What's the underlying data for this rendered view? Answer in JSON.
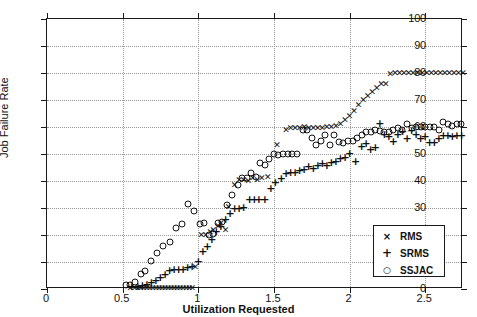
{
  "chart_data": {
    "type": "scatter",
    "title": "",
    "xlabel": "Utilization Requested",
    "ylabel": "Job Failure Rate",
    "xlim": [
      0,
      2.75
    ],
    "ylim": [
      0,
      100
    ],
    "xticks": [
      "0",
      "0.5",
      "1",
      "1.5",
      "2",
      "2.5"
    ],
    "xtick_values": [
      0,
      0.5,
      1,
      1.5,
      2,
      2.5
    ],
    "yticks": [
      "0",
      "10",
      "20",
      "30",
      "40",
      "50",
      "60",
      "70",
      "80",
      "90",
      "100"
    ],
    "ytick_values": [
      0,
      10,
      20,
      30,
      40,
      50,
      60,
      70,
      80,
      90,
      100
    ],
    "grid": true,
    "legend_position": "lower-right",
    "series": [
      {
        "name": "RMS",
        "marker": "x",
        "points": [
          [
            0.55,
            0.3
          ],
          [
            0.58,
            0.3
          ],
          [
            0.6,
            0.3
          ],
          [
            0.62,
            0.3
          ],
          [
            0.64,
            0.3
          ],
          [
            0.66,
            0.3
          ],
          [
            0.68,
            0.3
          ],
          [
            0.7,
            0.3
          ],
          [
            0.72,
            0.3
          ],
          [
            0.74,
            0.3
          ],
          [
            0.76,
            0.3
          ],
          [
            0.78,
            0.3
          ],
          [
            0.8,
            0.3
          ],
          [
            0.82,
            0.3
          ],
          [
            0.84,
            0.3
          ],
          [
            0.86,
            0.3
          ],
          [
            0.88,
            0.3
          ],
          [
            0.9,
            0.3
          ],
          [
            0.92,
            0.3
          ],
          [
            0.94,
            0.3
          ],
          [
            0.96,
            0.3
          ],
          [
            0.98,
            8.0
          ],
          [
            1.02,
            20.0
          ],
          [
            1.05,
            20.0
          ],
          [
            1.08,
            21.0
          ],
          [
            1.1,
            22.0
          ],
          [
            1.13,
            23.5
          ],
          [
            1.15,
            24.5
          ],
          [
            1.18,
            22.0
          ],
          [
            1.2,
            30.5
          ],
          [
            1.24,
            38.5
          ],
          [
            1.27,
            40.5
          ],
          [
            1.3,
            40.5
          ],
          [
            1.33,
            40.0
          ],
          [
            1.36,
            41.0
          ],
          [
            1.39,
            40.5
          ],
          [
            1.42,
            41.0
          ],
          [
            1.46,
            41.5
          ],
          [
            1.52,
            53.5
          ],
          [
            1.58,
            59.0
          ],
          [
            1.61,
            59.5
          ],
          [
            1.64,
            59.5
          ],
          [
            1.67,
            59.5
          ],
          [
            1.7,
            60.0
          ],
          [
            1.73,
            59.5
          ],
          [
            1.76,
            59.5
          ],
          [
            1.79,
            59.5
          ],
          [
            1.82,
            59.5
          ],
          [
            1.85,
            60.0
          ],
          [
            1.88,
            60.0
          ],
          [
            1.91,
            60.5
          ],
          [
            1.94,
            61.0
          ],
          [
            1.97,
            62.5
          ],
          [
            2.0,
            64.0
          ],
          [
            2.03,
            66.0
          ],
          [
            2.06,
            68.0
          ],
          [
            2.09,
            70.0
          ],
          [
            2.12,
            71.5
          ],
          [
            2.15,
            73.0
          ],
          [
            2.18,
            74.5
          ],
          [
            2.21,
            76.0
          ],
          [
            2.24,
            76.0
          ],
          [
            2.27,
            79.5
          ],
          [
            2.3,
            80.0
          ],
          [
            2.33,
            80.0
          ],
          [
            2.36,
            80.0
          ],
          [
            2.39,
            80.0
          ],
          [
            2.42,
            80.0
          ],
          [
            2.45,
            80.0
          ],
          [
            2.48,
            80.0
          ],
          [
            2.51,
            80.0
          ],
          [
            2.54,
            80.0
          ],
          [
            2.57,
            80.0
          ],
          [
            2.6,
            80.0
          ],
          [
            2.63,
            80.0
          ],
          [
            2.66,
            80.0
          ],
          [
            2.69,
            80.0
          ],
          [
            2.72,
            80.0
          ],
          [
            2.75,
            80.0
          ]
        ]
      },
      {
        "name": "SRMS",
        "marker": "+",
        "points": [
          [
            0.56,
            1.0
          ],
          [
            0.6,
            1.0
          ],
          [
            0.63,
            1.5
          ],
          [
            0.66,
            2.0
          ],
          [
            0.69,
            2.5
          ],
          [
            0.72,
            3.5
          ],
          [
            0.75,
            4.5
          ],
          [
            0.78,
            5.5
          ],
          [
            0.81,
            7.0
          ],
          [
            0.84,
            7.5
          ],
          [
            0.87,
            7.5
          ],
          [
            0.9,
            7.5
          ],
          [
            0.93,
            8.0
          ],
          [
            0.96,
            8.5
          ],
          [
            1.0,
            10.5
          ],
          [
            1.03,
            14.0
          ],
          [
            1.06,
            16.0
          ],
          [
            1.09,
            18.5
          ],
          [
            1.12,
            21.5
          ],
          [
            1.15,
            23.5
          ],
          [
            1.18,
            26.0
          ],
          [
            1.21,
            28.0
          ],
          [
            1.24,
            30.0
          ],
          [
            1.27,
            30.0
          ],
          [
            1.3,
            30.5
          ],
          [
            1.34,
            33.5
          ],
          [
            1.37,
            33.5
          ],
          [
            1.4,
            33.5
          ],
          [
            1.44,
            33.5
          ],
          [
            1.48,
            37.5
          ],
          [
            1.51,
            39.5
          ],
          [
            1.55,
            41.0
          ],
          [
            1.58,
            43.0
          ],
          [
            1.61,
            43.5
          ],
          [
            1.64,
            43.5
          ],
          [
            1.67,
            44.0
          ],
          [
            1.7,
            44.5
          ],
          [
            1.73,
            45.5
          ],
          [
            1.76,
            45.0
          ],
          [
            1.79,
            46.0
          ],
          [
            1.82,
            46.5
          ],
          [
            1.85,
            46.0
          ],
          [
            1.88,
            47.0
          ],
          [
            1.91,
            47.5
          ],
          [
            1.94,
            48.5
          ],
          [
            1.97,
            49.0
          ],
          [
            2.0,
            50.5
          ],
          [
            2.04,
            47.5
          ],
          [
            2.08,
            53.0
          ],
          [
            2.11,
            54.0
          ],
          [
            2.14,
            52.0
          ],
          [
            2.17,
            52.5
          ],
          [
            2.2,
            61.5
          ],
          [
            2.23,
            57.5
          ],
          [
            2.26,
            56.5
          ],
          [
            2.29,
            55.0
          ],
          [
            2.32,
            57.5
          ],
          [
            2.35,
            58.5
          ],
          [
            2.38,
            56.0
          ],
          [
            2.41,
            59.0
          ],
          [
            2.44,
            57.5
          ],
          [
            2.47,
            56.0
          ],
          [
            2.5,
            56.5
          ],
          [
            2.53,
            54.5
          ],
          [
            2.56,
            54.5
          ],
          [
            2.59,
            56.0
          ],
          [
            2.62,
            57.0
          ],
          [
            2.65,
            57.0
          ],
          [
            2.68,
            56.5
          ],
          [
            2.71,
            57.0
          ],
          [
            2.74,
            57.0
          ]
        ]
      },
      {
        "name": "SSJAC",
        "marker": "o",
        "points": [
          [
            0.52,
            1.5
          ],
          [
            0.55,
            1.5
          ],
          [
            0.58,
            2.5
          ],
          [
            0.62,
            5.5
          ],
          [
            0.65,
            6.5
          ],
          [
            0.69,
            10.5
          ],
          [
            0.73,
            13.5
          ],
          [
            0.77,
            16.0
          ],
          [
            0.81,
            17.5
          ],
          [
            0.85,
            22.5
          ],
          [
            0.89,
            24.0
          ],
          [
            0.93,
            31.5
          ],
          [
            0.97,
            29.0
          ],
          [
            1.01,
            24.0
          ],
          [
            1.04,
            24.5
          ],
          [
            1.07,
            20.0
          ],
          [
            1.1,
            20.5
          ],
          [
            1.13,
            24.5
          ],
          [
            1.16,
            25.0
          ],
          [
            1.19,
            31.0
          ],
          [
            1.22,
            35.0
          ],
          [
            1.26,
            38.5
          ],
          [
            1.29,
            41.0
          ],
          [
            1.32,
            41.0
          ],
          [
            1.35,
            43.0
          ],
          [
            1.38,
            41.5
          ],
          [
            1.41,
            46.5
          ],
          [
            1.44,
            46.0
          ],
          [
            1.47,
            48.0
          ],
          [
            1.5,
            50.0
          ],
          [
            1.53,
            49.5
          ],
          [
            1.56,
            50.0
          ],
          [
            1.59,
            50.0
          ],
          [
            1.62,
            50.0
          ],
          [
            1.65,
            50.0
          ],
          [
            1.69,
            59.0
          ],
          [
            1.72,
            59.0
          ],
          [
            1.75,
            56.0
          ],
          [
            1.78,
            53.5
          ],
          [
            1.81,
            55.0
          ],
          [
            1.84,
            57.0
          ],
          [
            1.87,
            53.5
          ],
          [
            1.9,
            57.0
          ],
          [
            1.93,
            54.5
          ],
          [
            1.96,
            54.0
          ],
          [
            1.99,
            55.0
          ],
          [
            2.02,
            55.0
          ],
          [
            2.05,
            56.0
          ],
          [
            2.08,
            57.0
          ],
          [
            2.11,
            58.0
          ],
          [
            2.14,
            58.0
          ],
          [
            2.17,
            59.0
          ],
          [
            2.2,
            58.5
          ],
          [
            2.23,
            58.0
          ],
          [
            2.26,
            58.0
          ],
          [
            2.29,
            59.0
          ],
          [
            2.32,
            59.5
          ],
          [
            2.35,
            59.0
          ],
          [
            2.38,
            61.0
          ],
          [
            2.41,
            59.5
          ],
          [
            2.44,
            60.0
          ],
          [
            2.47,
            60.0
          ],
          [
            2.5,
            60.0
          ],
          [
            2.53,
            60.0
          ],
          [
            2.56,
            60.0
          ],
          [
            2.59,
            59.0
          ],
          [
            2.62,
            62.0
          ],
          [
            2.65,
            61.0
          ],
          [
            2.68,
            60.5
          ],
          [
            2.71,
            61.0
          ],
          [
            2.74,
            61.0
          ]
        ]
      }
    ]
  },
  "legend": {
    "entries": [
      {
        "symbol": "×",
        "label": "RMS"
      },
      {
        "symbol": "+",
        "label": "SRMS"
      },
      {
        "symbol": "○",
        "label": "SSJAC"
      }
    ]
  },
  "axes": {
    "y_title": "Job Failure Rate",
    "x_title": "Utilization Requested"
  },
  "colors": {
    "axis": "#1a1a1a",
    "grid": "#9a9a9a",
    "marker": "#111111",
    "background": "#ffffff"
  }
}
